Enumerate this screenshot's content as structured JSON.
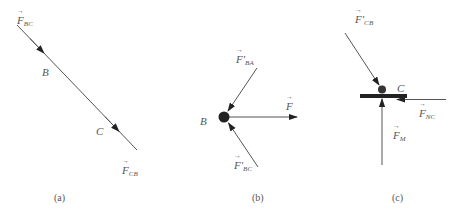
{
  "figure": {
    "colors": {
      "line": "#555555",
      "dot": "#222222",
      "beam": "#222222",
      "text": "#555555"
    },
    "panels": [
      {
        "id": "a",
        "caption": "(a)",
        "labels": {
          "force_top": {
            "symbol": "F",
            "sub": "BC"
          },
          "point_b": "B",
          "point_c": "C",
          "force_bottom": {
            "symbol": "F",
            "sub": "CB"
          }
        }
      },
      {
        "id": "b",
        "caption": "(b)",
        "labels": {
          "force_ba": {
            "symbol": "F",
            "prime": "'",
            "sub": "BA"
          },
          "force_f": {
            "symbol": "F",
            "sub": ""
          },
          "point_b": "B",
          "force_bc": {
            "symbol": "F",
            "prime": "'",
            "sub": "BC"
          }
        }
      },
      {
        "id": "c",
        "caption": "(c)",
        "labels": {
          "force_cb": {
            "symbol": "F",
            "prime": "'",
            "sub": "CB"
          },
          "point_c": "C",
          "force_nc": {
            "symbol": "F",
            "sub": "NC"
          },
          "force_m": {
            "symbol": "F",
            "sub": "M"
          }
        }
      }
    ]
  }
}
